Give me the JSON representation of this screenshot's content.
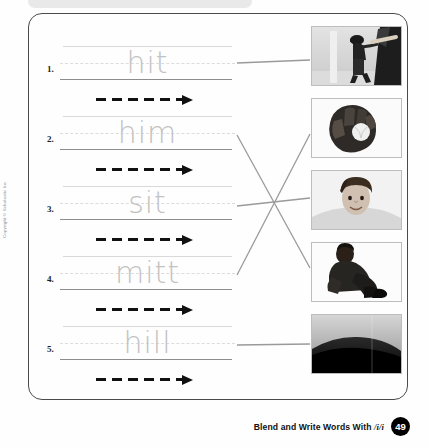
{
  "worksheet": {
    "title_hidden": "",
    "copyright": "Copyright © Scholastic Inc.",
    "rows": [
      {
        "number": "1.",
        "word": "hit",
        "arrow": "dashed-arrow-right"
      },
      {
        "number": "2.",
        "word": "him",
        "arrow": "dashed-arrow-right"
      },
      {
        "number": "3.",
        "word": "sit",
        "arrow": "dashed-arrow-right"
      },
      {
        "number": "4.",
        "word": "mitt",
        "arrow": "dashed-arrow-right"
      },
      {
        "number": "5.",
        "word": "hill",
        "arrow": "dashed-arrow-right"
      }
    ],
    "photos": [
      {
        "id": "photo-1",
        "alt": "boy swinging a baseball bat",
        "matches_word": "hit"
      },
      {
        "id": "photo-2",
        "alt": "baseball glove with ball",
        "matches_word": "mitt"
      },
      {
        "id": "photo-3",
        "alt": "portrait of a boy",
        "matches_word": "him"
      },
      {
        "id": "photo-4",
        "alt": "child sitting on the ground",
        "matches_word": "sit"
      },
      {
        "id": "photo-5",
        "alt": "dark hill against the sky",
        "matches_word": "hill"
      }
    ],
    "connections": [
      {
        "from_row": "1.",
        "to_photo": "photo-1"
      },
      {
        "from_row": "2.",
        "to_photo": "photo-4"
      },
      {
        "from_row": "3.",
        "to_photo": "photo-3"
      },
      {
        "from_row": "4.",
        "to_photo": "photo-2"
      },
      {
        "from_row": "5.",
        "to_photo": "photo-5"
      }
    ]
  },
  "footer": {
    "label_before": "Blend and Write Words With ",
    "phoneme": "/i/i",
    "page_number": "49"
  },
  "colors": {
    "trace_gray": "#c2c2c2",
    "baseline_gray": "#8d8d8d",
    "frame_gray": "#4a4a4a",
    "connector_gray": "#9a9a9a",
    "arrow_black": "#111111",
    "badge_black": "#000000"
  }
}
